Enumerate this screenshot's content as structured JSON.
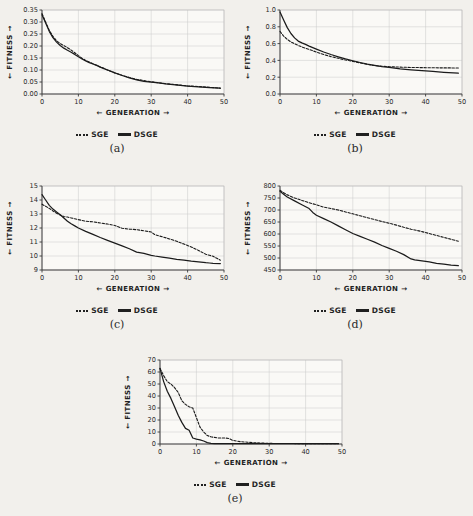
{
  "figure": {
    "background": "#f2f0ec",
    "series_names": [
      "SGE",
      "DSGE"
    ],
    "legend": {
      "sge_label": "SGE",
      "dsge_label": "DSGE"
    },
    "axis_titles": {
      "x": "← GENERATION →",
      "y": "← FITNESS →"
    },
    "captions": {
      "a": "(a)",
      "b": "(b)",
      "c": "(c)",
      "d": "(d)",
      "e": "(e)"
    }
  },
  "chart_data": [
    {
      "id": "a",
      "type": "line",
      "title": "(a)",
      "xlabel": "← GENERATION →",
      "ylabel": "← FITNESS →",
      "xlim": [
        0,
        50
      ],
      "ylim": [
        0.0,
        0.35
      ],
      "xticks": [
        0,
        10,
        20,
        30,
        40,
        50
      ],
      "yticks": [
        0.0,
        0.05,
        0.1,
        0.15,
        0.2,
        0.25,
        0.3,
        0.35
      ],
      "ytick_labels": [
        "0.00",
        "0.05",
        "0.10",
        "0.15",
        "0.20",
        "0.25",
        "0.30",
        "0.35"
      ],
      "grid": true,
      "legend_position": "below",
      "x": [
        0,
        1,
        2,
        3,
        4,
        5,
        6,
        7,
        8,
        9,
        10,
        11,
        12,
        13,
        14,
        15,
        16,
        17,
        18,
        19,
        20,
        22,
        24,
        26,
        28,
        30,
        32,
        34,
        36,
        38,
        40,
        42,
        44,
        46,
        49
      ],
      "series": [
        {
          "name": "SGE",
          "style": "dashed",
          "values": [
            0.335,
            0.3,
            0.265,
            0.24,
            0.222,
            0.21,
            0.202,
            0.193,
            0.183,
            0.172,
            0.16,
            0.149,
            0.14,
            0.133,
            0.126,
            0.12,
            0.113,
            0.107,
            0.1,
            0.094,
            0.088,
            0.078,
            0.069,
            0.061,
            0.056,
            0.051,
            0.047,
            0.043,
            0.04,
            0.037,
            0.034,
            0.032,
            0.03,
            0.028,
            0.024
          ]
        },
        {
          "name": "DSGE",
          "style": "solid",
          "values": [
            0.33,
            0.296,
            0.261,
            0.235,
            0.216,
            0.202,
            0.191,
            0.182,
            0.174,
            0.165,
            0.155,
            0.146,
            0.138,
            0.131,
            0.125,
            0.119,
            0.112,
            0.106,
            0.1,
            0.094,
            0.088,
            0.077,
            0.067,
            0.059,
            0.053,
            0.049,
            0.046,
            0.042,
            0.039,
            0.036,
            0.033,
            0.031,
            0.029,
            0.027,
            0.024
          ]
        }
      ]
    },
    {
      "id": "b",
      "type": "line",
      "title": "(b)",
      "xlabel": "← GENERATION →",
      "ylabel": "← FITNESS →",
      "xlim": [
        0,
        50
      ],
      "ylim": [
        0.0,
        1.0
      ],
      "xticks": [
        0,
        10,
        20,
        30,
        40,
        50
      ],
      "yticks": [
        0.0,
        0.2,
        0.4,
        0.6,
        0.8,
        1.0
      ],
      "ytick_labels": [
        "0.0",
        "0.2",
        "0.4",
        "0.6",
        "0.8",
        "1.0"
      ],
      "grid": true,
      "legend_position": "below",
      "x": [
        0,
        1,
        2,
        3,
        4,
        5,
        6,
        7,
        8,
        9,
        10,
        12,
        14,
        16,
        18,
        20,
        22,
        24,
        26,
        28,
        30,
        33,
        36,
        39,
        42,
        45,
        49
      ],
      "series": [
        {
          "name": "SGE",
          "style": "dashed",
          "values": [
            0.745,
            0.69,
            0.65,
            0.62,
            0.598,
            0.578,
            0.56,
            0.545,
            0.53,
            0.515,
            0.5,
            0.47,
            0.445,
            0.425,
            0.405,
            0.388,
            0.37,
            0.352,
            0.338,
            0.33,
            0.325,
            0.32,
            0.316,
            0.314,
            0.312,
            0.311,
            0.31
          ]
        },
        {
          "name": "DSGE",
          "style": "solid",
          "values": [
            0.975,
            0.88,
            0.79,
            0.72,
            0.668,
            0.63,
            0.608,
            0.59,
            0.57,
            0.552,
            0.535,
            0.5,
            0.47,
            0.443,
            0.418,
            0.396,
            0.375,
            0.356,
            0.34,
            0.326,
            0.316,
            0.3,
            0.288,
            0.278,
            0.268,
            0.258,
            0.248
          ]
        }
      ]
    },
    {
      "id": "c",
      "type": "line",
      "title": "(c)",
      "xlabel": "← GENERATION →",
      "ylabel": "← FITNESS →",
      "xlim": [
        0,
        50
      ],
      "ylim": [
        9,
        15
      ],
      "xticks": [
        0,
        10,
        20,
        30,
        40,
        50
      ],
      "yticks": [
        9,
        10,
        11,
        12,
        13,
        14,
        15
      ],
      "ytick_labels": [
        "9",
        "10",
        "11",
        "12",
        "13",
        "14",
        "15"
      ],
      "grid": true,
      "legend_position": "below",
      "x": [
        0,
        1,
        2,
        3,
        4,
        5,
        6,
        7,
        8,
        9,
        10,
        12,
        14,
        16,
        18,
        20,
        22,
        24,
        26,
        28,
        30,
        31,
        33,
        35,
        37,
        39,
        41,
        43,
        45,
        46,
        47,
        49
      ],
      "series": [
        {
          "name": "SGE",
          "style": "dashed",
          "values": [
            13.7,
            13.55,
            13.4,
            13.22,
            13.05,
            12.92,
            12.82,
            12.78,
            12.72,
            12.66,
            12.6,
            12.48,
            12.44,
            12.36,
            12.28,
            12.18,
            11.98,
            11.92,
            11.88,
            11.8,
            11.72,
            11.52,
            11.38,
            11.22,
            11.05,
            10.85,
            10.65,
            10.4,
            10.12,
            10.05,
            9.98,
            9.7
          ]
        },
        {
          "name": "DSGE",
          "style": "solid",
          "values": [
            14.38,
            14.0,
            13.62,
            13.35,
            13.15,
            12.95,
            12.72,
            12.48,
            12.3,
            12.15,
            12.0,
            11.76,
            11.54,
            11.32,
            11.12,
            10.92,
            10.72,
            10.52,
            10.28,
            10.18,
            10.05,
            10.0,
            9.92,
            9.84,
            9.76,
            9.7,
            9.63,
            9.58,
            9.52,
            9.5,
            9.48,
            9.46
          ]
        }
      ]
    },
    {
      "id": "d",
      "type": "line",
      "title": "(d)",
      "xlabel": "← GENERATION →",
      "ylabel": "← FITNESS →",
      "xlim": [
        0,
        50
      ],
      "ylim": [
        450,
        800
      ],
      "xticks": [
        0,
        10,
        20,
        30,
        40,
        50
      ],
      "yticks": [
        450,
        500,
        550,
        600,
        650,
        700,
        750,
        800
      ],
      "ytick_labels": [
        "450",
        "500",
        "550",
        "600",
        "650",
        "700",
        "750",
        "800"
      ],
      "grid": true,
      "legend_position": "below",
      "x": [
        0,
        1,
        2,
        4,
        6,
        8,
        9,
        10,
        12,
        14,
        16,
        18,
        20,
        22,
        24,
        26,
        28,
        30,
        32,
        34,
        36,
        37,
        39,
        41,
        43,
        45,
        47,
        49
      ],
      "series": [
        {
          "name": "SGE",
          "style": "dashed",
          "values": [
            782,
            772,
            763,
            750,
            740,
            730,
            726,
            722,
            712,
            706,
            700,
            692,
            684,
            676,
            668,
            660,
            652,
            645,
            637,
            628,
            620,
            617,
            610,
            602,
            594,
            586,
            578,
            570
          ]
        },
        {
          "name": "DSGE",
          "style": "solid",
          "values": [
            778,
            766,
            754,
            738,
            722,
            706,
            690,
            678,
            664,
            650,
            634,
            618,
            602,
            590,
            578,
            566,
            552,
            540,
            528,
            514,
            496,
            492,
            488,
            484,
            478,
            474,
            470,
            468
          ]
        }
      ]
    },
    {
      "id": "e",
      "type": "line",
      "title": "(e)",
      "xlabel": "← GENERATION →",
      "ylabel": "← FITNESS →",
      "xlim": [
        0,
        50
      ],
      "ylim": [
        0,
        70
      ],
      "xticks": [
        0,
        10,
        20,
        30,
        40,
        50
      ],
      "yticks": [
        0,
        10,
        20,
        30,
        40,
        50,
        60,
        70
      ],
      "ytick_labels": [
        "0",
        "10",
        "20",
        "30",
        "40",
        "50",
        "60",
        "70"
      ],
      "grid": true,
      "legend_position": "below",
      "x": [
        0,
        1,
        2,
        3,
        4,
        5,
        6,
        7,
        8,
        9,
        10,
        11,
        12,
        13,
        14,
        15,
        16,
        17,
        18,
        19,
        20,
        21,
        22,
        24,
        26,
        28,
        30,
        35,
        40,
        45,
        49
      ],
      "series": [
        {
          "name": "SGE",
          "style": "dashed",
          "values": [
            63,
            57,
            52,
            50,
            47,
            43,
            36,
            33,
            31,
            30,
            22,
            14,
            10,
            7,
            6,
            5.5,
            5,
            5,
            5,
            4.5,
            3,
            2.5,
            2,
            1.5,
            1,
            0.8,
            0.5,
            0.4,
            0.3,
            0.3,
            0.3
          ]
        },
        {
          "name": "DSGE",
          "style": "solid",
          "values": [
            63,
            52,
            44,
            38,
            31,
            24,
            18,
            13,
            11.5,
            5,
            4,
            3.5,
            2.5,
            1.2,
            0.6,
            0.4,
            0.3,
            0.3,
            0.3,
            0.3,
            0.3,
            0.3,
            0.3,
            0.3,
            0.3,
            0.3,
            0.3,
            0.3,
            0.3,
            0.3,
            0.3
          ]
        }
      ]
    }
  ]
}
